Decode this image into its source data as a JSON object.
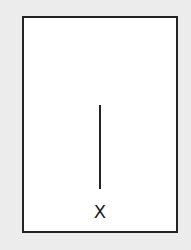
{
  "diagram": {
    "label": "X",
    "colors": {
      "background": "#ececec",
      "frame_fill": "#ffffff",
      "stroke": "#222222"
    }
  }
}
